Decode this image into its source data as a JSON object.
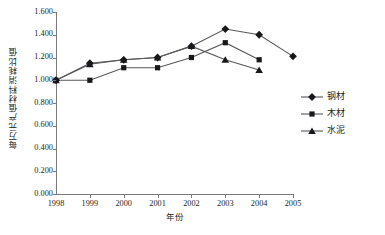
{
  "chart_data": {
    "type": "line",
    "title": "",
    "xlabel": "年份",
    "ylabel": "每万元产值材料消耗比值",
    "categories": [
      "1998",
      "1999",
      "2000",
      "2001",
      "2002",
      "2003",
      "2004",
      "2005"
    ],
    "x": [
      1998,
      1999,
      2000,
      2001,
      2002,
      2003,
      2004,
      2005
    ],
    "xlim": [
      1998,
      2005
    ],
    "ylim": [
      0.0,
      1.6
    ],
    "grid": false,
    "legend_position": "right",
    "y_ticks": [
      "0.000",
      "0.200",
      "0.400",
      "0.600",
      "0.800",
      "1.000",
      "1.200",
      "1.400",
      "1.600"
    ],
    "y_tick_values": [
      0.0,
      0.2,
      0.4,
      0.6,
      0.8,
      1.0,
      1.2,
      1.4,
      1.6
    ],
    "series": [
      {
        "name": "钢材",
        "marker": "diamond",
        "color": "#18171c",
        "x": [
          1998,
          1999,
          2000,
          2001,
          2002,
          2003,
          2004,
          2005
        ],
        "values": [
          1.0,
          1.15,
          1.18,
          1.2,
          1.3,
          1.45,
          1.4,
          1.21
        ]
      },
      {
        "name": "木材",
        "marker": "square",
        "color": "#18171c",
        "x": [
          1998,
          1999,
          2000,
          2001,
          2002,
          2003,
          2004
        ],
        "values": [
          1.0,
          1.0,
          1.11,
          1.11,
          1.2,
          1.33,
          1.18
        ]
      },
      {
        "name": "水泥",
        "marker": "triangle",
        "color": "#18171c",
        "x": [
          1998,
          1999,
          2000,
          2001,
          2002,
          2003,
          2004
        ],
        "values": [
          1.0,
          1.14,
          1.18,
          1.2,
          1.3,
          1.18,
          1.09
        ]
      }
    ]
  },
  "legend": {
    "items": [
      {
        "label": "钢材",
        "marker": "diamond"
      },
      {
        "label": "木材",
        "marker": "square"
      },
      {
        "label": "水泥",
        "marker": "triangle"
      }
    ]
  },
  "axes": {
    "y_title": "每万元产值材料消耗比值",
    "x_title": "年份"
  },
  "colors": {
    "line": "#58585a",
    "marker": "#18171c",
    "axis": "#7b7b7b",
    "text": "#231f20",
    "background": "#ffffff"
  }
}
